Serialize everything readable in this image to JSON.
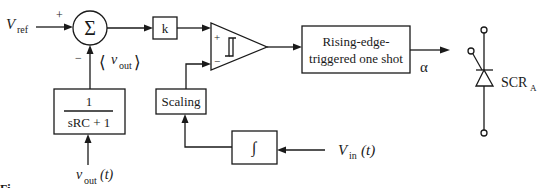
{
  "diagram": {
    "inputs": {
      "v_ref": {
        "main": "V",
        "sub": "ref"
      },
      "v_out_t": {
        "main": "v",
        "sub": "out",
        "suffix": "(t)"
      },
      "v_in_t": {
        "main": "V",
        "sub": "in",
        "suffix": "(t)"
      }
    },
    "summer": {
      "symbol": "Σ",
      "plus_sign": "+",
      "minus_sign": "−"
    },
    "avg_label": {
      "open": "⟨",
      "main": "v",
      "sub": "out",
      "close": "⟩"
    },
    "gain_block": {
      "label": "k"
    },
    "filter_block": {
      "numerator": "1",
      "denominator": "sRC + 1"
    },
    "comparator": {
      "plus_sign": "+",
      "minus_sign": "−",
      "icon": "hysteresis-icon"
    },
    "scaling_block": {
      "label": "Scaling"
    },
    "integrator_block": {
      "symbol": "∫"
    },
    "one_shot_block": {
      "line1": "Rising-edge-",
      "line2": "triggered one shot"
    },
    "output_label": "α",
    "scr": {
      "main": "SCR",
      "sub": "A",
      "icon": "thyristor-icon"
    },
    "caption_fragment": "Fi"
  }
}
